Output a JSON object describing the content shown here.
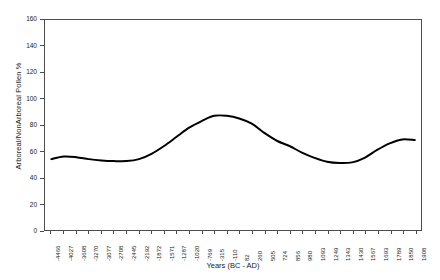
{
  "chart_data": {
    "type": "line",
    "title": "",
    "xlabel": "Years (BC - AD)",
    "ylabel": "Arboreal/NonArboreal Pollen %",
    "ylim": [
      0,
      160
    ],
    "yticks": [
      0,
      20,
      40,
      60,
      80,
      100,
      120,
      140,
      160
    ],
    "ytick_labels": [
      "0",
      "20",
      "40",
      "60",
      "80",
      "100",
      "120",
      "140",
      "160"
    ],
    "grid": false,
    "legend": null,
    "line_color": "#000000",
    "line_width": 2,
    "categories": [
      "-4466",
      "-4027",
      "-3608",
      "-3270",
      "-3077",
      "-2708",
      "-2445",
      "-2192",
      "-1872",
      "-1571",
      "-1287",
      "-1020",
      "-769",
      "-315",
      "-110",
      "82",
      "260",
      "505",
      "724",
      "856",
      "980",
      "1093",
      "1249",
      "1343",
      "1430",
      "1567",
      "1693",
      "1789",
      "1850",
      "1908"
    ],
    "values": [
      54,
      56,
      55.5,
      54,
      53,
      52.5,
      52.5,
      54,
      58,
      64,
      71,
      78,
      83,
      87,
      87,
      85,
      81,
      74,
      68,
      64,
      59,
      55,
      52,
      51,
      51.5,
      55,
      61,
      66,
      69,
      68.5
    ]
  }
}
